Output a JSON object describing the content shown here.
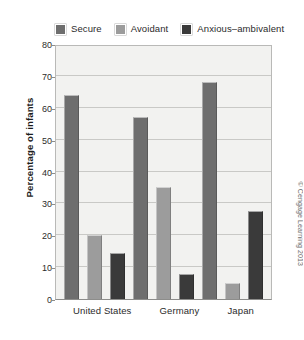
{
  "chart_data": {
    "type": "bar",
    "title": "",
    "xlabel": "",
    "ylabel": "Percentage of infants",
    "ylim": [
      0,
      80
    ],
    "ytick_values": [
      0,
      10,
      20,
      30,
      40,
      50,
      60,
      70,
      80
    ],
    "ytick_labels": [
      "0",
      "10",
      "20",
      "30",
      "40",
      "50",
      "60",
      "70",
      "80"
    ],
    "grid": true,
    "legend_position": "top",
    "categories": [
      "United States",
      "Germany",
      "Japan"
    ],
    "series": [
      {
        "name": "Secure",
        "color": "#6e6e6e",
        "values": [
          64,
          57,
          68
        ]
      },
      {
        "name": "Avoidant",
        "color": "#9c9c9c",
        "values": [
          20,
          35,
          5
        ]
      },
      {
        "name": "Anxious–ambivalent",
        "color": "#3a3a3a",
        "values": [
          14.5,
          8,
          27.5
        ]
      }
    ]
  },
  "legend": {
    "entries": [
      {
        "label": "Secure",
        "swatch": "legend-swatch-secure"
      },
      {
        "label": "Avoidant",
        "swatch": "legend-swatch-avoidant"
      },
      {
        "label": "Anxious–ambivalent",
        "swatch": "legend-swatch-anxious-ambivalent"
      }
    ]
  },
  "axis": {
    "ylabel": "Percentage of infants"
  },
  "credit": {
    "text": "© Cengage Learning 2013"
  },
  "colors": {
    "secure": "#6e6e6e",
    "avoidant": "#9c9c9c",
    "anxious": "#3a3a3a",
    "plot_background": "#f2f2f0",
    "gridline": "#c9c9c6",
    "frame": "#b9b9b7"
  }
}
